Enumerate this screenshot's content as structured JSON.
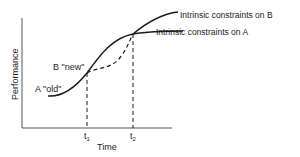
{
  "diagram": {
    "y_axis_label": "Performance",
    "x_axis_label": "Time",
    "ticks": {
      "t1": "t",
      "t1_sub": "1",
      "t2": "t",
      "t2_sub": "2"
    },
    "curves": {
      "a_label": "A \"old\"",
      "b_label": "B \"new\"",
      "b_constraint_label": "Intrinsic constraints on B",
      "a_constraint_label": "Intrinsic constraints on A"
    },
    "colors": {
      "line": "#1a1a1a",
      "axis": "#555555",
      "background": "#ffffff"
    }
  }
}
